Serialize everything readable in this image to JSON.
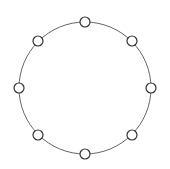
{
  "diagram": {
    "type": "ring-topology",
    "canvas": {
      "width": 170,
      "height": 169,
      "background": "#ffffff"
    },
    "ring": {
      "cx": 85,
      "cy": 88,
      "r": 66,
      "stroke": "#666666",
      "stroke_width": 1
    },
    "node_style": {
      "r": 5,
      "fill": "#ffffff",
      "stroke": "#333333",
      "stroke_width": 1.2
    },
    "nodes": [
      {
        "id": "n-top",
        "x": 85,
        "y": 22
      },
      {
        "id": "n-top-right",
        "x": 132,
        "y": 41
      },
      {
        "id": "n-right",
        "x": 151,
        "y": 88
      },
      {
        "id": "n-bottom-right",
        "x": 132,
        "y": 135
      },
      {
        "id": "n-bottom",
        "x": 85,
        "y": 154
      },
      {
        "id": "n-bottom-left",
        "x": 38,
        "y": 135
      },
      {
        "id": "n-left",
        "x": 19,
        "y": 88
      },
      {
        "id": "n-top-left",
        "x": 38,
        "y": 41
      }
    ]
  }
}
